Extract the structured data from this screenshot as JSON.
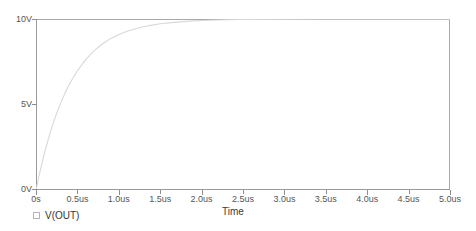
{
  "chart_data": {
    "type": "line",
    "title": "",
    "subtitle": "",
    "xlabel": "Time",
    "ylabel": "",
    "xlim": [
      0,
      5.0
    ],
    "ylim": [
      0,
      10
    ],
    "x_unit": "us",
    "y_unit": "V",
    "grid": false,
    "legend_position": "bottom-left",
    "x_tick_labels": [
      "0s",
      "0.5us",
      "1.0us",
      "1.5us",
      "2.0us",
      "2.5us",
      "3.0us",
      "3.5us",
      "4.0us",
      "4.5us",
      "5.0us"
    ],
    "x_tick_values": [
      0,
      0.5,
      1.0,
      1.5,
      2.0,
      2.5,
      3.0,
      3.5,
      4.0,
      4.5,
      5.0
    ],
    "y_tick_labels": [
      "0V",
      "5V",
      "10V"
    ],
    "y_tick_values": [
      0,
      5,
      10
    ],
    "series": [
      {
        "name": "V(OUT)",
        "color": "#d8d8d8",
        "description": "RC step response charging to 10V",
        "model": "10*(1-exp(-t/0.42us))",
        "x": [
          0,
          0.05,
          0.1,
          0.15,
          0.2,
          0.25,
          0.3,
          0.35,
          0.4,
          0.45,
          0.5,
          0.6,
          0.7,
          0.8,
          0.9,
          1.0,
          1.1,
          1.2,
          1.3,
          1.4,
          1.5,
          1.7,
          1.9,
          2.1,
          2.3,
          2.5,
          3.0,
          3.5,
          4.0,
          4.5,
          5.0
        ],
        "y": [
          0,
          1.12,
          2.12,
          3.01,
          3.79,
          4.49,
          5.11,
          5.66,
          6.15,
          6.58,
          6.97,
          7.62,
          8.14,
          8.54,
          8.85,
          9.09,
          9.28,
          9.43,
          9.55,
          9.64,
          9.72,
          9.82,
          9.89,
          9.93,
          9.96,
          9.97,
          9.99,
          10.0,
          10.0,
          10.0,
          10.0
        ]
      }
    ],
    "legend": [
      {
        "label": "V(OUT)",
        "marker": "hollow-square",
        "color": "#b4b4b4"
      }
    ]
  },
  "axis": {
    "x_title": "Time"
  }
}
